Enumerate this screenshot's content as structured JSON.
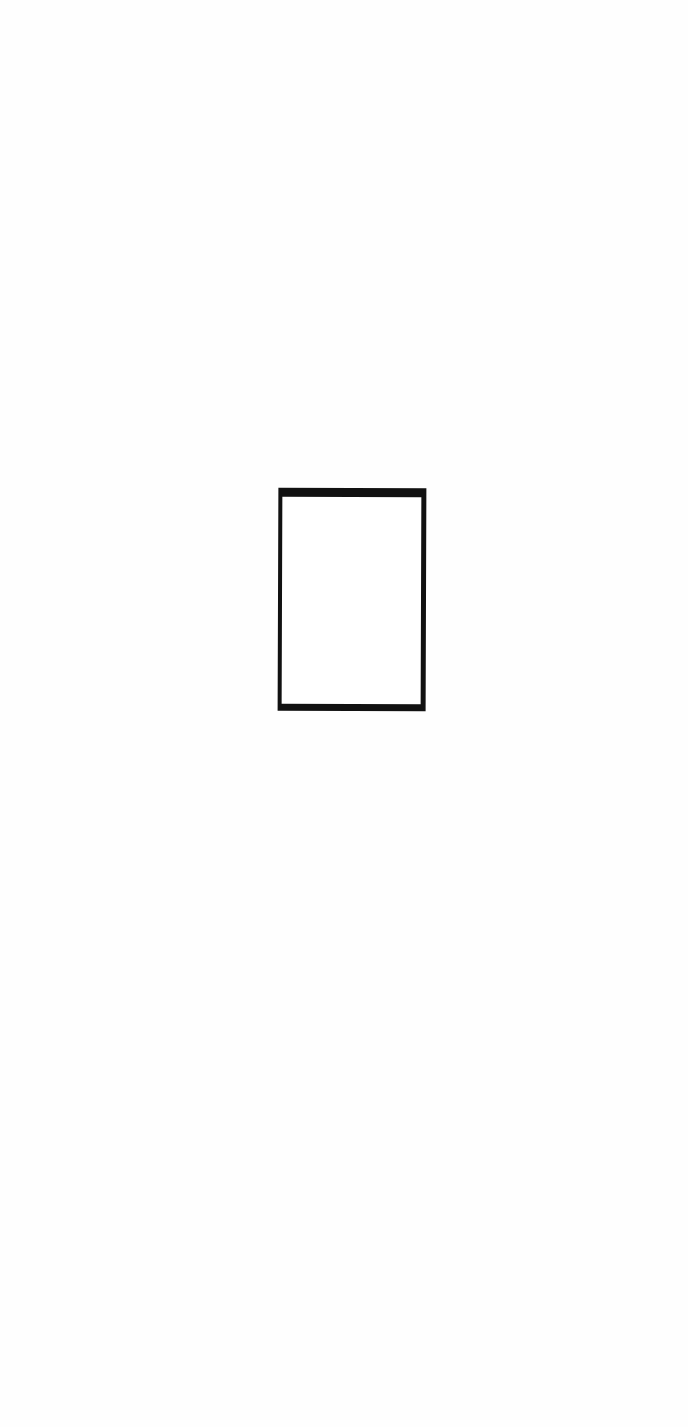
{
  "page": {
    "background_color": "#fefefe"
  },
  "shape": {
    "type": "rectangle-outline",
    "stroke_color": "#111111",
    "fill_color": "#ffffff"
  }
}
